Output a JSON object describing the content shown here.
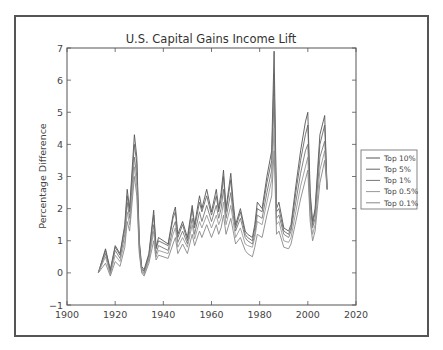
{
  "chart_data": {
    "type": "line",
    "title": "U.S. Capital Gains Income Lift",
    "xlabel": "",
    "ylabel": "Percentage Difference",
    "xlim": [
      1900,
      2020
    ],
    "ylim": [
      -1,
      7
    ],
    "xticks": [
      "1900",
      "1920",
      "1940",
      "1960",
      "1980",
      "2000",
      "2020"
    ],
    "yticks": [
      "−1",
      "0",
      "1",
      "2",
      "3",
      "4",
      "5",
      "6",
      "7"
    ],
    "grid": false,
    "legend_position": "outside right",
    "x": [
      1913,
      1916,
      1918,
      1920,
      1922,
      1924,
      1925,
      1926,
      1928,
      1929,
      1930,
      1931,
      1932,
      1934,
      1936,
      1937,
      1938,
      1942,
      1944,
      1945,
      1946,
      1948,
      1950,
      1952,
      1953,
      1955,
      1956,
      1958,
      1960,
      1962,
      1963,
      1964,
      1965,
      1966,
      1968,
      1969,
      1970,
      1972,
      1974,
      1975,
      1977,
      1978,
      1979,
      1981,
      1983,
      1985,
      1986,
      1987,
      1988,
      1990,
      1992,
      1993,
      1995,
      1997,
      1999,
      2000,
      2001,
      2002,
      2003,
      2005,
      2007,
      2008
    ],
    "series": [
      {
        "name": "Top 10%",
        "color": "#555555",
        "values": [
          0,
          0.75,
          0.1,
          0.85,
          0.6,
          1.5,
          2.6,
          2.0,
          4.3,
          3.6,
          1.0,
          0.2,
          0.1,
          0.6,
          1.95,
          0.8,
          1.1,
          0.9,
          1.8,
          2.05,
          1.2,
          1.6,
          1.1,
          2.1,
          1.5,
          2.4,
          2.0,
          2.6,
          1.9,
          2.6,
          2.0,
          2.5,
          3.2,
          2.0,
          3.1,
          2.2,
          1.5,
          2.0,
          1.3,
          1.2,
          1.1,
          1.5,
          2.2,
          2.0,
          3.0,
          3.8,
          6.9,
          2.0,
          2.2,
          1.4,
          1.3,
          1.5,
          2.7,
          3.8,
          4.7,
          5.0,
          2.5,
          1.6,
          2.0,
          4.3,
          4.9,
          2.6
        ]
      },
      {
        "name": "Top 5%",
        "color": "#666666",
        "values": [
          0,
          0.7,
          0.05,
          0.8,
          0.55,
          1.4,
          2.4,
          1.9,
          4.0,
          3.4,
          0.9,
          0.15,
          0.05,
          0.55,
          1.8,
          0.75,
          1.0,
          0.85,
          1.7,
          1.9,
          1.1,
          1.5,
          1.0,
          2.0,
          1.4,
          2.2,
          1.9,
          2.4,
          1.8,
          2.4,
          1.9,
          2.3,
          3.0,
          1.9,
          2.9,
          2.0,
          1.4,
          1.9,
          1.2,
          1.1,
          1.0,
          1.4,
          2.0,
          1.9,
          2.8,
          3.5,
          6.2,
          1.9,
          2.0,
          1.3,
          1.2,
          1.4,
          2.5,
          3.5,
          4.3,
          4.6,
          2.3,
          1.5,
          1.9,
          4.0,
          4.6,
          2.6
        ]
      },
      {
        "name": "Top 1%",
        "color": "#777777",
        "values": [
          0,
          0.6,
          0.0,
          0.7,
          0.45,
          1.2,
          2.2,
          1.7,
          3.6,
          3.0,
          0.8,
          0.1,
          0.0,
          0.45,
          1.5,
          0.6,
          0.85,
          0.7,
          1.4,
          1.6,
          0.95,
          1.3,
          0.9,
          1.7,
          1.2,
          1.9,
          1.6,
          2.1,
          1.6,
          2.1,
          1.7,
          2.0,
          2.6,
          1.7,
          2.5,
          1.8,
          1.3,
          1.7,
          1.1,
          1.0,
          0.9,
          1.2,
          1.8,
          1.7,
          2.5,
          3.2,
          5.5,
          1.7,
          1.8,
          1.2,
          1.1,
          1.3,
          2.2,
          3.1,
          3.8,
          4.0,
          2.1,
          1.4,
          1.7,
          3.6,
          4.1,
          2.6
        ]
      },
      {
        "name": "Top 0.5%",
        "color": "#999999",
        "values": [
          0,
          0.5,
          -0.05,
          0.55,
          0.35,
          1.0,
          1.9,
          1.5,
          3.3,
          2.7,
          0.7,
          0.05,
          -0.05,
          0.4,
          1.3,
          0.5,
          0.7,
          0.6,
          1.2,
          1.4,
          0.8,
          1.1,
          0.8,
          1.5,
          1.05,
          1.6,
          1.4,
          1.8,
          1.4,
          1.8,
          1.5,
          1.7,
          2.2,
          1.5,
          2.1,
          1.6,
          1.1,
          1.4,
          0.9,
          0.85,
          0.8,
          1.1,
          1.6,
          1.5,
          2.2,
          2.9,
          4.5,
          1.5,
          1.6,
          1.0,
          0.95,
          1.1,
          1.9,
          2.7,
          3.3,
          3.6,
          1.8,
          1.2,
          1.5,
          3.2,
          3.8,
          2.6
        ]
      },
      {
        "name": "Top 0.1%",
        "color": "#888888",
        "values": [
          0,
          0.3,
          -0.1,
          0.35,
          0.2,
          0.8,
          1.6,
          1.3,
          3.0,
          2.4,
          0.6,
          0.0,
          -0.1,
          0.3,
          1.0,
          0.4,
          0.55,
          0.45,
          0.9,
          1.1,
          0.6,
          0.9,
          0.6,
          1.2,
          0.85,
          1.3,
          1.1,
          1.5,
          1.1,
          1.5,
          1.2,
          1.4,
          1.8,
          1.2,
          1.7,
          1.3,
          0.9,
          1.1,
          0.7,
          0.6,
          0.5,
          0.8,
          1.2,
          1.1,
          1.8,
          2.4,
          3.8,
          1.2,
          1.3,
          0.8,
          0.75,
          0.9,
          1.6,
          2.3,
          2.9,
          3.2,
          1.6,
          1.0,
          1.3,
          2.8,
          3.5,
          2.6
        ]
      }
    ]
  }
}
